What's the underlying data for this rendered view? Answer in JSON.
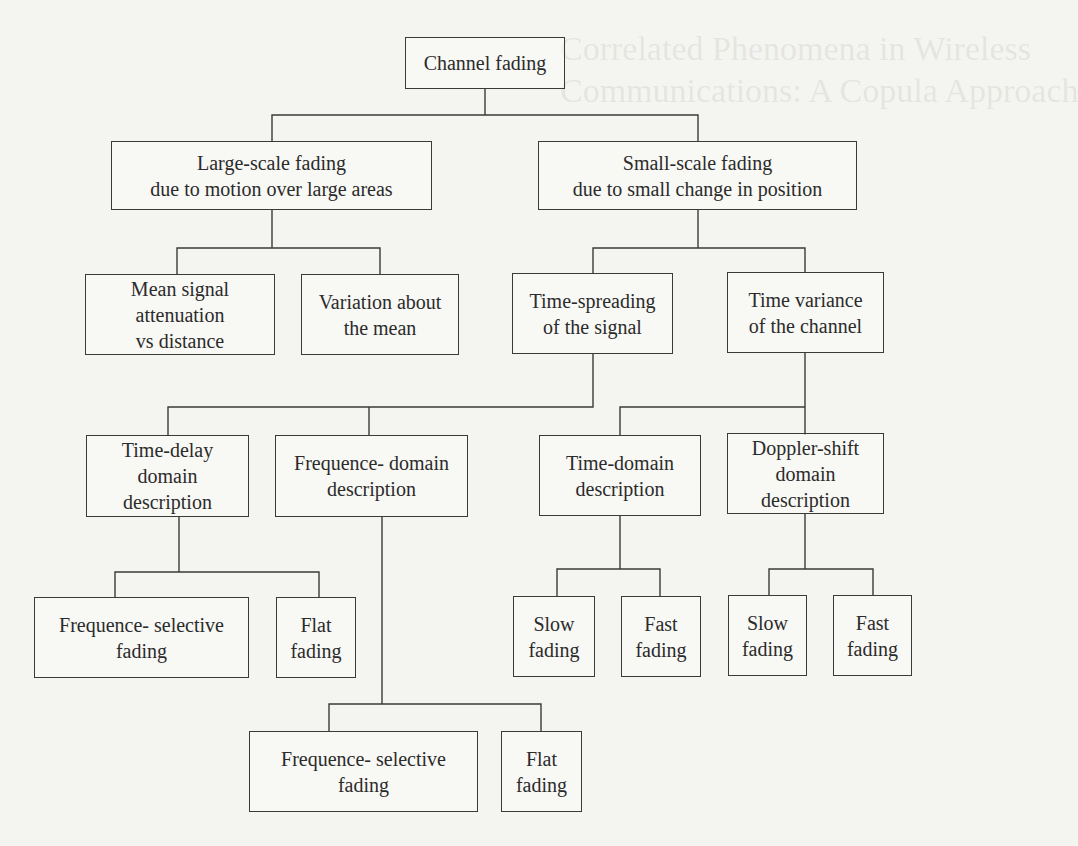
{
  "diagram": {
    "nodes": [
      {
        "id": "channel-fading",
        "label": "Channel fading",
        "x": 405,
        "y": 37,
        "w": 160,
        "h": 52
      },
      {
        "id": "large-scale-fading",
        "label": "Large-scale fading\ndue to motion over large areas",
        "x": 111,
        "y": 141,
        "w": 321,
        "h": 69
      },
      {
        "id": "small-scale-fading",
        "label": "Small-scale fading\ndue to small change in position",
        "x": 538,
        "y": 141,
        "w": 319,
        "h": 69
      },
      {
        "id": "mean-signal-attenuation",
        "label": "Mean signal\nattenuation\nvs distance",
        "x": 85,
        "y": 274,
        "w": 190,
        "h": 81
      },
      {
        "id": "variation-about-mean",
        "label": "Variation about\nthe mean",
        "x": 301,
        "y": 274,
        "w": 158,
        "h": 81
      },
      {
        "id": "time-spreading",
        "label": "Time-spreading\nof the signal",
        "x": 512,
        "y": 273,
        "w": 161,
        "h": 81
      },
      {
        "id": "time-variance",
        "label": "Time variance\nof the channel",
        "x": 727,
        "y": 272,
        "w": 157,
        "h": 81
      },
      {
        "id": "time-delay-domain",
        "label": "Time-delay\ndomain\ndescription",
        "x": 86,
        "y": 435,
        "w": 163,
        "h": 82
      },
      {
        "id": "frequence-domain",
        "label": "Frequence- domain\ndescription",
        "x": 275,
        "y": 435,
        "w": 193,
        "h": 82
      },
      {
        "id": "time-domain",
        "label": "Time-domain\ndescription",
        "x": 539,
        "y": 435,
        "w": 162,
        "h": 81
      },
      {
        "id": "doppler-shift-domain",
        "label": "Doppler-shift\ndomain\ndescription",
        "x": 727,
        "y": 433,
        "w": 157,
        "h": 81
      },
      {
        "id": "freq-selective-fading-1",
        "label": "Frequence- selective\nfading",
        "x": 34,
        "y": 597,
        "w": 215,
        "h": 81
      },
      {
        "id": "flat-fading-1",
        "label": "Flat\nfading",
        "x": 276,
        "y": 597,
        "w": 80,
        "h": 81
      },
      {
        "id": "slow-fading-1",
        "label": "Slow\nfading",
        "x": 513,
        "y": 596,
        "w": 82,
        "h": 81
      },
      {
        "id": "fast-fading-1",
        "label": "Fast\nfading",
        "x": 621,
        "y": 596,
        "w": 80,
        "h": 81
      },
      {
        "id": "slow-fading-2",
        "label": "Slow\nfading",
        "x": 728,
        "y": 595,
        "w": 79,
        "h": 81
      },
      {
        "id": "fast-fading-2",
        "label": "Fast\nfading",
        "x": 833,
        "y": 595,
        "w": 79,
        "h": 81
      },
      {
        "id": "freq-selective-fading-2",
        "label": "Frequence- selective\nfading",
        "x": 249,
        "y": 731,
        "w": 229,
        "h": 81
      },
      {
        "id": "flat-fading-2",
        "label": "Flat\nfading",
        "x": 501,
        "y": 731,
        "w": 81,
        "h": 81
      }
    ],
    "edges": [
      [
        "channel-fading",
        "large-scale-fading"
      ],
      [
        "channel-fading",
        "small-scale-fading"
      ],
      [
        "large-scale-fading",
        "mean-signal-attenuation"
      ],
      [
        "large-scale-fading",
        "variation-about-mean"
      ],
      [
        "small-scale-fading",
        "time-spreading"
      ],
      [
        "small-scale-fading",
        "time-variance"
      ],
      [
        "time-spreading",
        "time-delay-domain"
      ],
      [
        "time-spreading",
        "frequence-domain"
      ],
      [
        "time-variance",
        "time-domain"
      ],
      [
        "time-variance",
        "doppler-shift-domain"
      ],
      [
        "time-delay-domain",
        "freq-selective-fading-1"
      ],
      [
        "time-delay-domain",
        "flat-fading-1"
      ],
      [
        "frequence-domain",
        "freq-selective-fading-2"
      ],
      [
        "frequence-domain",
        "flat-fading-2"
      ],
      [
        "time-domain",
        "slow-fading-1"
      ],
      [
        "time-domain",
        "fast-fading-1"
      ],
      [
        "doppler-shift-domain",
        "slow-fading-2"
      ],
      [
        "doppler-shift-domain",
        "fast-fading-2"
      ]
    ]
  },
  "colors": {
    "line": "#3a3a3a",
    "background": "#f4f4f1",
    "text": "#2b2b2b"
  }
}
